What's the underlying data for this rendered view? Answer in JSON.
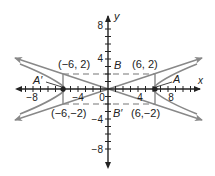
{
  "diagram": {
    "type": "hyperbola-graph",
    "axes": {
      "x_label": "x",
      "y_label": "y",
      "x_ticks": [
        {
          "value": -8,
          "label": "−8"
        },
        {
          "value": -4,
          "label": "−4"
        },
        {
          "value": 0,
          "label": "0"
        },
        {
          "value": 4,
          "label": "4"
        },
        {
          "value": 8,
          "label": "8"
        }
      ],
      "y_ticks": [
        {
          "value": 8,
          "label": "8"
        },
        {
          "value": 4,
          "label": "4"
        },
        {
          "value": -4,
          "label": "−4"
        },
        {
          "value": -8,
          "label": "−8"
        }
      ],
      "range": [
        -11,
        11
      ]
    },
    "points": {
      "top_left": "(−6, 2)",
      "top_right": "(6, 2)",
      "bottom_left": "(−6,−2)",
      "bottom_right": "(6,−2)"
    },
    "vertex_labels": {
      "A": "A",
      "A_prime": "A′",
      "B": "B",
      "B_prime": "B′"
    },
    "colors": {
      "curve": "#888888",
      "axis": "#222222",
      "dashed": "#777777"
    }
  }
}
